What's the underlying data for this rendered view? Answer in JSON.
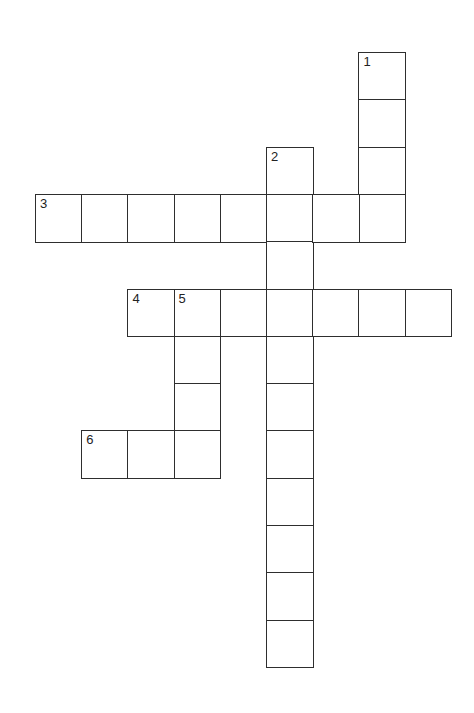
{
  "puzzle": {
    "type": "crossword",
    "cell_width": 46.2,
    "cell_height": 47.3,
    "origin_x": 35,
    "origin_y": 52,
    "line_color": "#2e2e2e",
    "entries": [
      {
        "number": "1",
        "direction": "down",
        "row": 0,
        "col": 7,
        "length": 4
      },
      {
        "number": "2",
        "direction": "down",
        "row": 2,
        "col": 5,
        "length": 11
      },
      {
        "number": "3",
        "direction": "across",
        "row": 3,
        "col": 0,
        "length": 8
      },
      {
        "number": "4",
        "direction": "across",
        "row": 5,
        "col": 2,
        "length": 7
      },
      {
        "number": "5",
        "direction": "down",
        "row": 5,
        "col": 3,
        "length": 4
      },
      {
        "number": "6",
        "direction": "across",
        "row": 8,
        "col": 1,
        "length": 3
      }
    ]
  }
}
